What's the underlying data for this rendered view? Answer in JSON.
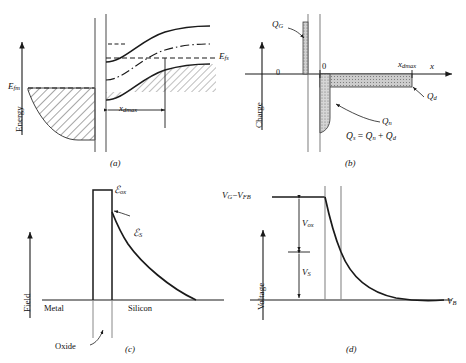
{
  "figure": {
    "panels": [
      "(a)",
      "(b)",
      "(c)",
      "(d)"
    ]
  },
  "panel_a": {
    "caption": "(a)",
    "yaxis_label": "Energy",
    "labels": {
      "metal_fermi": "E",
      "metal_fermi_sub": "fm",
      "semi_fermi": "E",
      "semi_fermi_sub": "fs",
      "depletion_width": "x",
      "depletion_width_sub": "dmax"
    }
  },
  "panel_b": {
    "caption": "(b)",
    "yaxis_label": "Charge",
    "xaxis_label": "x",
    "origin_left": "0",
    "origin_right": "0",
    "labels": {
      "gate_charge": "Q",
      "gate_charge_sub": "G",
      "inversion_charge": "Q",
      "inversion_charge_sub": "n",
      "depletion_charge": "Q",
      "depletion_charge_sub": "d",
      "depletion_width": "x",
      "depletion_width_sub": "dmax"
    },
    "equation": "Qₛ = Qₙ + Q_d",
    "equation_parts": {
      "lhs": "Q",
      "lhs_sub": "s",
      "eq": "=",
      "t1": "Q",
      "t1_sub": "n",
      "plus": "+",
      "t2": "Q",
      "t2_sub": "d"
    }
  },
  "panel_c": {
    "caption": "(c)",
    "yaxis_label": "Field",
    "labels": {
      "oxide_field": "ℰ",
      "oxide_field_sub": "ox",
      "surface_field": "ℰ",
      "surface_field_sub": "S"
    },
    "regions": {
      "left": "Metal",
      "right": "Silicon",
      "middle": "Oxide"
    }
  },
  "panel_d": {
    "caption": "(d)",
    "yaxis_label": "Voltage",
    "labels": {
      "gate_voltage": "V",
      "gate_voltage_sub": "G",
      "minus": "−",
      "flatband_voltage": "V",
      "flatband_voltage_sub": "FB",
      "oxide_voltage": "V",
      "oxide_voltage_sub": "ox",
      "surface_voltage": "V",
      "surface_voltage_sub": "S",
      "bulk_voltage": "V",
      "bulk_voltage_sub": "B"
    }
  },
  "colors": {
    "ink": "#1a1a1a",
    "hatch": "#333333",
    "fill_light": "#d9d9d9",
    "fill_mid": "#c9c9c9",
    "rule": "#555555"
  }
}
